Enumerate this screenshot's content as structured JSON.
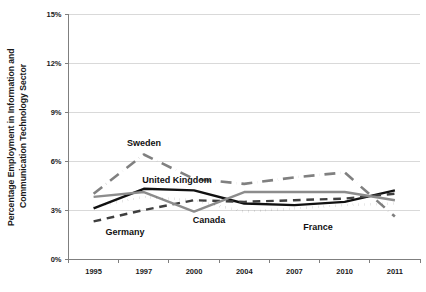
{
  "chart_data": {
    "type": "line",
    "title": "",
    "xlabel": "",
    "ylabel": "Percentage Employment in Information and Communication Technology Sector",
    "categories": [
      "1995",
      "1997",
      "2000",
      "2004",
      "2007",
      "2010",
      "2011"
    ],
    "ytick_labels": [
      "0%",
      "3%",
      "6%",
      "9%",
      "12%",
      "15%"
    ],
    "ytick_values": [
      0,
      3,
      6,
      9,
      12,
      15
    ],
    "ylim": [
      0,
      15
    ],
    "grid": "horizontal",
    "legend": "inline-annotations",
    "series": [
      {
        "name": "Sweden",
        "style": "dash-dot",
        "color": "#808080",
        "values": [
          4.0,
          6.4,
          4.9,
          4.6,
          5.0,
          5.3,
          2.6
        ]
      },
      {
        "name": "United Kingdom",
        "style": "solid",
        "color": "#111111",
        "values": [
          3.1,
          4.3,
          4.2,
          3.4,
          3.3,
          3.5,
          4.2
        ]
      },
      {
        "name": "Germany",
        "style": "dashed",
        "color": "#3f3f3f",
        "values": [
          2.3,
          3.0,
          3.6,
          3.5,
          3.6,
          3.7,
          4.0
        ]
      },
      {
        "name": "Canada",
        "style": "solid",
        "color": "#8c8c8c",
        "values": [
          3.8,
          4.1,
          2.9,
          4.1,
          4.1,
          4.1,
          3.6
        ]
      },
      {
        "name": "France",
        "style": "dotted",
        "color": "#111111",
        "values": [
          3.2,
          3.8,
          3.6,
          2.9,
          3.1,
          3.3,
          3.4
        ]
      }
    ],
    "annotations": [
      {
        "text": "Sweden",
        "x_px": 144,
        "y_px": 146
      },
      {
        "text": "United Kingdom",
        "x_px": 177,
        "y_px": 183
      },
      {
        "text": "Germany",
        "x_px": 125,
        "y_px": 235
      },
      {
        "text": "Canada",
        "x_px": 209,
        "y_px": 223
      },
      {
        "text": "France",
        "x_px": 318,
        "y_px": 230
      }
    ]
  }
}
